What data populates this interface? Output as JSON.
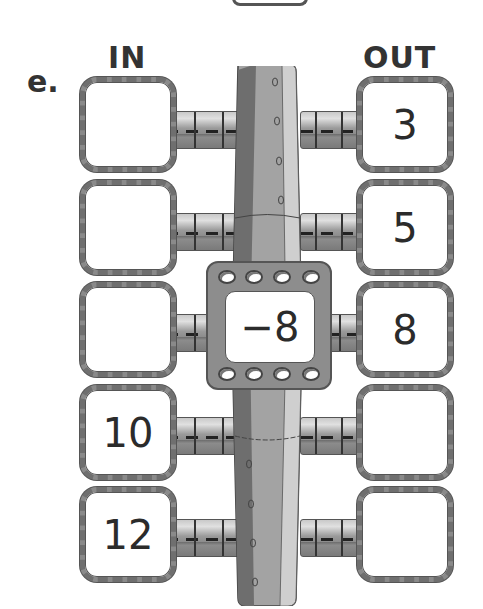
{
  "exercise": {
    "label": "e.",
    "in_header": "IN",
    "out_header": "OUT",
    "rule": "−8",
    "rows": [
      {
        "in": "",
        "out": "3"
      },
      {
        "in": "",
        "out": "5"
      },
      {
        "in": "",
        "out": "8"
      },
      {
        "in": "10",
        "out": ""
      },
      {
        "in": "12",
        "out": ""
      }
    ]
  },
  "colors": {
    "box_border": "#8a8a8a",
    "machine_dark": "#6e6e6e",
    "machine_mid": "#a3a3a3",
    "machine_light": "#cfcfcf",
    "text": "#2b2b2b"
  }
}
